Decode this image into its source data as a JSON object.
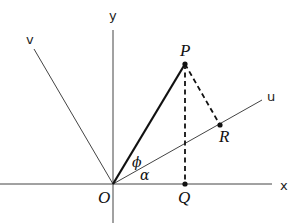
{
  "diagram": {
    "axes": {
      "x_label": "x",
      "y_label": "y",
      "u_label": "u",
      "v_label": "v"
    },
    "points": {
      "origin": "O",
      "P": "P",
      "Q": "Q",
      "R": "R"
    },
    "angles": {
      "phi": "ϕ",
      "alpha": "α"
    },
    "colors": {
      "line": "#222222",
      "background": "#ffffff"
    }
  }
}
